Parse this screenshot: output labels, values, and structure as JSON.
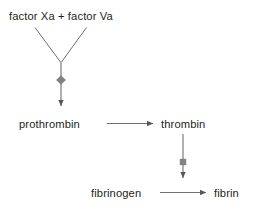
{
  "diagram": {
    "type": "flow-diagram",
    "canvas": {
      "width": 263,
      "height": 214,
      "background": "#ffffff"
    },
    "colors": {
      "text": "#231f20",
      "stroke": "#6d6e71",
      "marker_fill": "#808285"
    },
    "nodes": [
      {
        "id": "factors",
        "label": "factor Xa + factor Va",
        "x": 9,
        "y": 10
      },
      {
        "id": "prothrombin",
        "label": "prothrombin",
        "x": 19,
        "y": 118
      },
      {
        "id": "thrombin",
        "label": "thrombin",
        "x": 161,
        "y": 118
      },
      {
        "id": "fibrinogen",
        "label": "fibrinogen",
        "x": 91,
        "y": 187
      },
      {
        "id": "fibrin",
        "label": "fibrin",
        "x": 214,
        "y": 187
      }
    ],
    "edges": [
      {
        "id": "factors-left-branch",
        "from": "factor Xa",
        "to": "junction",
        "kind": "line",
        "marker": "none"
      },
      {
        "id": "factors-right-branch",
        "from": "factor Va",
        "to": "junction",
        "kind": "line",
        "marker": "none"
      },
      {
        "id": "junction-to-prothrombin",
        "from": "junction",
        "to": "prothrombin",
        "kind": "arrow",
        "marker": "diamond"
      },
      {
        "id": "prothrombin-to-thrombin",
        "from": "prothrombin",
        "to": "thrombin",
        "kind": "arrow",
        "marker": "none"
      },
      {
        "id": "thrombin-to-fibrinogen",
        "from": "thrombin",
        "to": "fibrinogen",
        "kind": "arrow",
        "marker": "square"
      },
      {
        "id": "fibrinogen-to-fibrin",
        "from": "fibrinogen",
        "to": "fibrin",
        "kind": "arrow",
        "marker": "none"
      }
    ],
    "markers": [
      {
        "id": "catalysis-marker-prothrombinase",
        "shape": "diamond",
        "x": 61,
        "y": 80
      },
      {
        "id": "catalysis-marker-thrombin",
        "shape": "square",
        "x": 183,
        "y": 162
      }
    ]
  }
}
